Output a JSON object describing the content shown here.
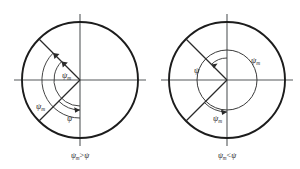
{
  "figure": {
    "background_color": "#ffffff",
    "line_color": "#1c1c1c",
    "axis_color": "#55585a",
    "symbols": {
      "psi": "ψ",
      "psi_sub": "m",
      "greater_than": ">",
      "less_than": "<"
    }
  },
  "panels": [
    {
      "id": "left",
      "name": "psi-m-greater-than-psi",
      "center_x": 80,
      "center_y": 80,
      "outer_radius": 58,
      "caption": {
        "full": "ψm > ψ",
        "lhs_symbol": "ψ",
        "lhs_subscript": "m",
        "operator": ">",
        "rhs_symbol": "ψ",
        "x": 80,
        "y": 158
      },
      "labels": [
        {
          "name": "psi-m-upper",
          "symbol": "ψ",
          "subscript": "m",
          "x": 62,
          "y": 78
        },
        {
          "name": "psi-m-lower-left",
          "symbol": "ψ",
          "subscript": "m",
          "x": 38,
          "y": 108
        },
        {
          "name": "psi-lower",
          "symbol": "ψ",
          "subscript": "",
          "x": 68,
          "y": 120
        }
      ],
      "arcs": [
        {
          "name": "arc-psi-m-outer",
          "radius": 38,
          "start_deg": 270,
          "end_deg": 135
        },
        {
          "name": "arc-psi-m-inner",
          "radius": 26,
          "start_deg": 270,
          "end_deg": 135
        },
        {
          "name": "arc-psi-lower",
          "radius": 30,
          "start_deg": 270,
          "end_deg": 315
        }
      ],
      "radials": [
        {
          "name": "radial-upper-left",
          "angle_deg": 135,
          "length": 58
        },
        {
          "name": "radial-lower-left",
          "angle_deg": 315,
          "length": 58
        }
      ]
    },
    {
      "id": "right",
      "name": "psi-m-less-than-psi",
      "center_x": 227,
      "center_y": 80,
      "outer_radius": 58,
      "inner_radius": 30,
      "caption": {
        "full": "ψm < ψ",
        "lhs_symbol": "ψ",
        "lhs_subscript": "m",
        "operator": "<",
        "rhs_symbol": "ψ",
        "x": 227,
        "y": 158
      },
      "labels": [
        {
          "name": "psi-left",
          "symbol": "ψ",
          "subscript": "",
          "x": 196,
          "y": 72
        },
        {
          "name": "psi-m-right",
          "symbol": "ψ",
          "subscript": "m",
          "x": 254,
          "y": 62
        },
        {
          "name": "psi-m-lower",
          "symbol": "ψ",
          "subscript": "m",
          "x": 216,
          "y": 120
        }
      ],
      "arcs": [
        {
          "name": "arc-psi-upper",
          "radius": 22,
          "start_deg": 90,
          "end_deg": 135
        },
        {
          "name": "arc-psi-m-lower",
          "radius": 32,
          "start_deg": 270,
          "end_deg": 315
        }
      ],
      "radials": [
        {
          "name": "radial-upper-left",
          "angle_deg": 135,
          "length": 58
        },
        {
          "name": "radial-lower-left",
          "angle_deg": 315,
          "length": 58
        }
      ]
    }
  ]
}
